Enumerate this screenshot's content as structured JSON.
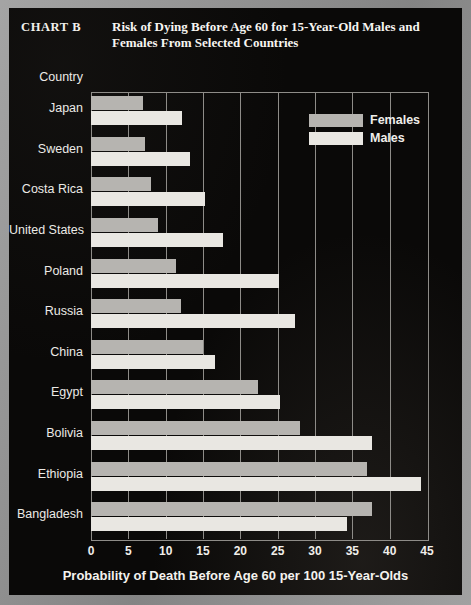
{
  "header": {
    "chart_label": "CHART  B",
    "title": "Risk of Dying Before Age 60 for 15-Year-Old Males and Females From Selected Countries"
  },
  "legend": {
    "position": "top-right",
    "entries": [
      {
        "label": "Females",
        "color": "#b6b4b0"
      },
      {
        "label": "Males",
        "color": "#e9e7e2"
      }
    ]
  },
  "axes": {
    "y_axis_label": "Country",
    "x_axis_label": "Probability of Death Before Age 60 per 100 15-Year-Olds",
    "x_ticks": [
      "0",
      "5",
      "10",
      "15",
      "20",
      "25",
      "30",
      "35",
      "40",
      "45"
    ]
  },
  "chart_data": {
    "type": "bar",
    "orientation": "horizontal",
    "title": "Risk of Dying Before Age 60 for 15-Year-Old Males and Females From Selected Countries",
    "xlabel": "Probability of Death Before Age 60 per 100 15-Year-Olds",
    "ylabel": "Country",
    "xlim": [
      0,
      45
    ],
    "xticks": [
      0,
      5,
      10,
      15,
      20,
      25,
      30,
      35,
      40,
      45
    ],
    "grid": true,
    "grid_axis": "x",
    "legend_position": "top-right",
    "categories": [
      "Japan",
      "Sweden",
      "Costa Rica",
      "United States",
      "Poland",
      "Russia",
      "China",
      "Egypt",
      "Bolivia",
      "Ethiopia",
      "Bangladesh"
    ],
    "series": [
      {
        "name": "Females",
        "color": "#b6b4b0",
        "values": [
          7,
          7.2,
          8,
          9,
          11.4,
          12,
          15,
          22.4,
          28,
          37,
          37.6
        ]
      },
      {
        "name": "Males",
        "color": "#e9e7e2",
        "values": [
          12.2,
          13.3,
          15.3,
          17.7,
          25.2,
          27.3,
          16.6,
          25.3,
          37.6,
          44.2,
          34.3
        ]
      }
    ]
  }
}
